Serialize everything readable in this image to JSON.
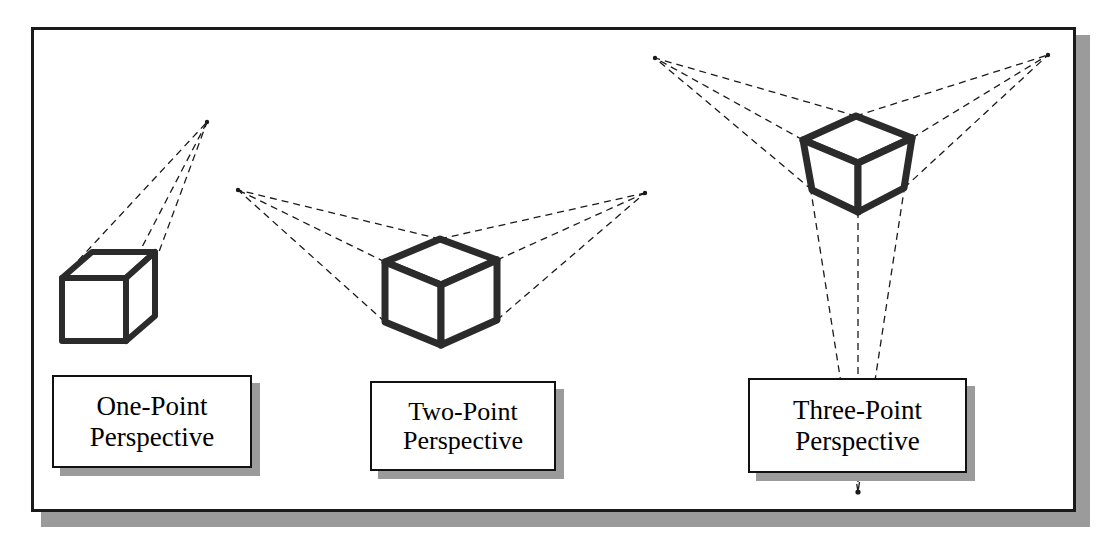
{
  "figure": {
    "title_ghost": "",
    "background_color": "#ffffff",
    "frame_color": "#1a1a1a",
    "shadow_color": "#9b9b9b",
    "cube_stroke_color": "#2b2b2b",
    "construction_line_color": "#1a1a1a",
    "label_text_color": "#000000"
  },
  "diagrams": [
    {
      "id": "one-point",
      "label_line1": "One-Point",
      "label_line2": "Perspective",
      "vanishing_points": [
        {
          "name": "VP",
          "x": 207,
          "y": 122
        }
      ],
      "vanishing_point_count": 1,
      "cube": {
        "front_top_left": {
          "x": 62,
          "y": 278
        },
        "front_top_right": {
          "x": 126,
          "y": 278
        },
        "front_bottom_left": {
          "x": 62,
          "y": 341
        },
        "front_bottom_right": {
          "x": 126,
          "y": 341
        },
        "back_top_left": {
          "x": 92,
          "y": 252
        },
        "back_top_right": {
          "x": 155,
          "y": 252
        },
        "back_bottom_right": {
          "x": 155,
          "y": 316
        }
      }
    },
    {
      "id": "two-point",
      "label_line1": "Two-Point",
      "label_line2": "Perspective",
      "vanishing_points": [
        {
          "name": "VP-left",
          "x": 238,
          "y": 190
        },
        {
          "name": "VP-right",
          "x": 645,
          "y": 193
        }
      ],
      "vanishing_point_count": 2,
      "cube": {
        "top_back": {
          "x": 440,
          "y": 239
        },
        "top_left": {
          "x": 385,
          "y": 262
        },
        "top_right": {
          "x": 497,
          "y": 260
        },
        "center": {
          "x": 441,
          "y": 285
        },
        "bottom_center": {
          "x": 441,
          "y": 345
        },
        "bottom_left": {
          "x": 385,
          "y": 322
        },
        "bottom_right": {
          "x": 497,
          "y": 320
        }
      }
    },
    {
      "id": "three-point",
      "label_line1": "Three-Point",
      "label_line2": "Perspective",
      "vanishing_points": [
        {
          "name": "VP-left",
          "x": 655,
          "y": 58
        },
        {
          "name": "VP-right",
          "x": 1048,
          "y": 55
        },
        {
          "name": "VP-down",
          "x": 858,
          "y": 492
        }
      ],
      "vanishing_point_count": 3,
      "cube": {
        "top_back": {
          "x": 856,
          "y": 116
        },
        "top_left": {
          "x": 803,
          "y": 140
        },
        "top_right": {
          "x": 912,
          "y": 138
        },
        "center": {
          "x": 858,
          "y": 163
        },
        "bottom_center": {
          "x": 858,
          "y": 212
        },
        "bottom_left": {
          "x": 812,
          "y": 190
        },
        "bottom_right": {
          "x": 904,
          "y": 188
        }
      }
    }
  ]
}
